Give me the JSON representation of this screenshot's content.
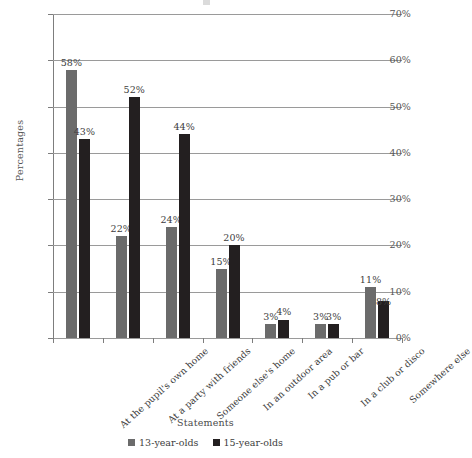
{
  "chart_data": {
    "type": "bar",
    "title": "",
    "xlabel": "Statements",
    "ylabel": "Percentages",
    "ylim": [
      0,
      70
    ],
    "ytick_labels": [
      "0%",
      "10%",
      "20%",
      "30%",
      "40%",
      "50%",
      "60%",
      "70%"
    ],
    "ytick_values": [
      0,
      10,
      20,
      30,
      40,
      50,
      60,
      70
    ],
    "grid": true,
    "legend_position": "bottom-center",
    "value_label_suffix": "%",
    "categories": [
      "At the pupil's own home",
      "At a party with friends",
      "Someone else's home",
      "In an outdoor area",
      "In a pub or bar",
      "In a club or disco",
      "Somewhere else"
    ],
    "series": [
      {
        "name": "13-year-olds",
        "color": "#6b6b6b",
        "values": [
          58,
          22,
          24,
          15,
          3,
          3,
          11
        ],
        "labels": [
          "58%",
          "22%",
          "24%",
          "15%",
          "3%",
          "3%",
          "11%"
        ]
      },
      {
        "name": "15-year-olds",
        "color": "#231f20",
        "values": [
          43,
          52,
          44,
          20,
          4,
          3,
          8
        ],
        "labels": [
          "43%",
          "52%",
          "44%",
          "20%",
          "4%",
          "3%",
          "8%"
        ]
      }
    ]
  },
  "colors": {
    "series_13": "#6b6b6b",
    "series_15": "#231f20",
    "gridline": "#9a9a9a",
    "axis": "#7d7d7d",
    "text": "#3d3d3d",
    "background": "#ffffff"
  }
}
